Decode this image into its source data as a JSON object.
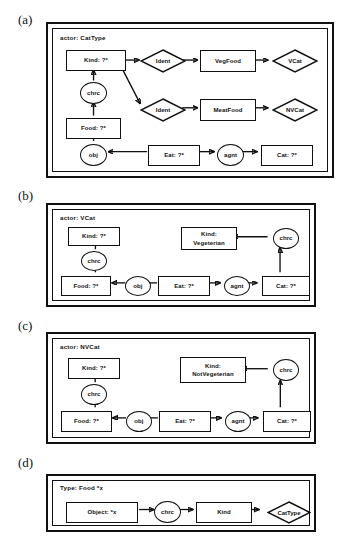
{
  "figure": {
    "panels": [
      {
        "tag": "(a)",
        "actor": "actor: CatType",
        "nodes": {
          "kind": "Kind: ?*",
          "chrc": "chrc",
          "food": "Food: ?*",
          "obj": "obj",
          "eat": "Eat: ?*",
          "agnt": "agnt",
          "cat": "Cat: ?*",
          "ident1": "Ident",
          "vegfood": "VegFood",
          "vcat": "VCat",
          "ident2": "Ident",
          "meatfood": "MeatFood",
          "nvcat": "NVCat"
        }
      },
      {
        "tag": "(b)",
        "actor": "actor: VCat",
        "nodes": {
          "kind": "Kind: ?*",
          "chrc_left": "chrc",
          "food": "Food: ?*",
          "obj": "obj",
          "eat": "Eat: ?*",
          "agnt": "agnt",
          "cat": "Cat: ?*",
          "chrc_right": "chrc",
          "kind_value_line1": "Kind:",
          "kind_value_line2": "Vegeterian"
        }
      },
      {
        "tag": "(c)",
        "actor": "actor: NVCat",
        "nodes": {
          "kind": "Kind: ?*",
          "chrc_left": "chrc",
          "food": "Food: ?*",
          "obj": "obj",
          "eat": "Eat: ?*",
          "agnt": "agnt",
          "cat": "Cat: ?*",
          "chrc_right": "chrc",
          "kind_value_line1": "Kind:",
          "kind_value_line2": "NotVegeterian"
        }
      },
      {
        "tag": "(d)",
        "actor": "Type: Food *x",
        "nodes": {
          "object": "Object: *x",
          "chrc": "chrc",
          "kind": "Kind",
          "cattype": "CatType"
        }
      }
    ]
  },
  "colors": {
    "stroke": "#111111",
    "background": "#ffffff"
  }
}
